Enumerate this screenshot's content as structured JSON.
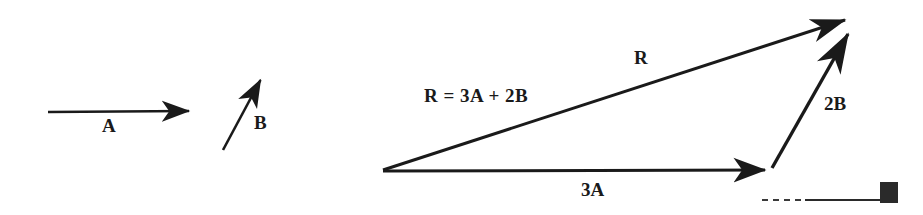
{
  "figure": {
    "background_color": "#ffffff",
    "ink_color": "#1a1a1a",
    "width": 923,
    "height": 215
  },
  "left_panel": {
    "caption": "Given vectors",
    "vectors": [
      {
        "name": "A",
        "label": "A",
        "x1": 48,
        "y1": 112,
        "x2": 196,
        "y2": 111,
        "label_x": 102,
        "label_y": 116
      },
      {
        "name": "B",
        "label": "B",
        "x1": 223,
        "y1": 150,
        "x2": 265,
        "y2": 72,
        "label_x": 254,
        "label_y": 113
      }
    ]
  },
  "right_panel": {
    "caption": "Resultant triangle",
    "origin": {
      "x": 381,
      "y": 171
    },
    "vectors": [
      {
        "name": "R",
        "label": "R",
        "x1": 383,
        "y1": 170,
        "x2": 857,
        "y2": 16,
        "label_x": 634,
        "label_y": 48
      },
      {
        "name": "3A",
        "label": "3A",
        "x1": 383,
        "y1": 171,
        "x2": 774,
        "y2": 170,
        "label_x": 581,
        "label_y": 180
      },
      {
        "name": "2B",
        "label": "2B",
        "x1": 772,
        "y1": 168,
        "x2": 858,
        "y2": 17,
        "label_x": 824,
        "label_y": 94
      }
    ],
    "equation": {
      "text": "R = 3A + 2B",
      "label_x": 424,
      "label_y": 86
    },
    "baseline": {
      "name": "reference-baseline",
      "dashed_x1": 762,
      "dashed_x2": 806,
      "solid_x1": 806,
      "solid_x2": 882,
      "y": 200
    },
    "marker_square": {
      "name": "corner-marker",
      "x": 880,
      "y": 182,
      "width": 18,
      "height": 21,
      "color": "#2a2a2a"
    }
  }
}
